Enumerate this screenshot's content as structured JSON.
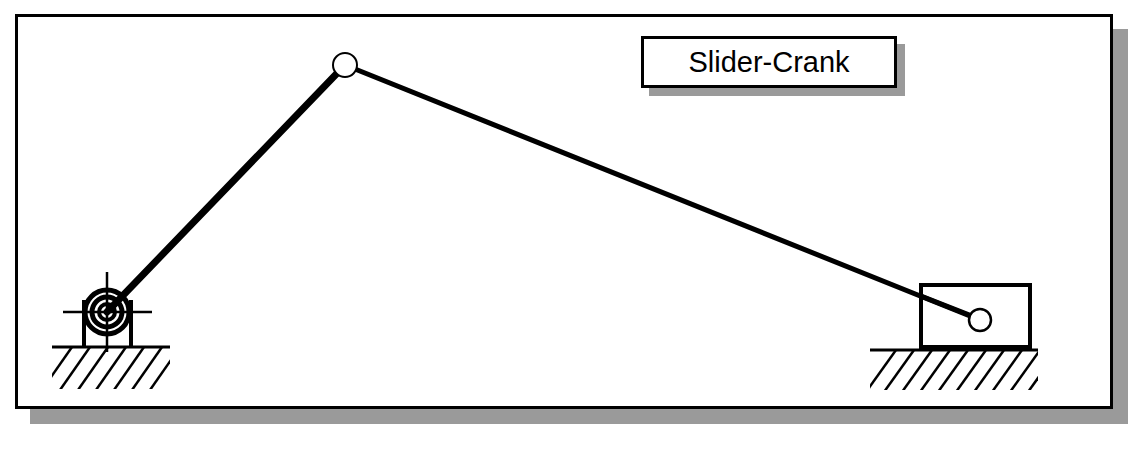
{
  "figure": {
    "title": "Slider-Crank",
    "type": "mechanism-diagram",
    "background_color": "#ffffff",
    "line_color": "#000000",
    "shadow_color": "#9a9a9a"
  },
  "frame": {
    "x": 15,
    "y": 14,
    "width": 1098,
    "height": 395,
    "border_width": 3,
    "shadow_offset": 15
  },
  "title_box": {
    "label": "Slider-Crank",
    "x": 641,
    "y": 36,
    "width": 256,
    "height": 52,
    "border_width": 3,
    "shadow_offset": 8
  },
  "mechanism": {
    "joints": [
      {
        "name": "ground-pivot",
        "type": "revolute-fixed",
        "x": 107,
        "y": 312,
        "bearing_radii": [
          10,
          16,
          22
        ]
      },
      {
        "name": "crank-pin",
        "type": "revolute",
        "x": 345,
        "y": 65,
        "radius": 12
      },
      {
        "name": "slider-pin",
        "type": "revolute",
        "x": 980,
        "y": 320,
        "radius": 11
      }
    ],
    "links": [
      {
        "name": "crank",
        "from": "ground-pivot",
        "to": "crank-pin",
        "x1": 107,
        "y1": 312,
        "x2": 345,
        "y2": 65,
        "stroke_width": 7
      },
      {
        "name": "connecting-rod",
        "from": "crank-pin",
        "to": "slider-pin",
        "x1": 345,
        "y1": 65,
        "x2": 980,
        "y2": 320,
        "stroke_width": 5
      }
    ],
    "slider_block": {
      "name": "slider",
      "x": 921,
      "y": 285,
      "width": 109,
      "height": 62,
      "stroke_width": 4
    },
    "pedestal": {
      "name": "pivot-pedestal",
      "left_wall_x": 84,
      "right_wall_x": 131,
      "top_y": 300,
      "bottom_y": 347,
      "stroke_width": 4
    },
    "centerlines": {
      "horizontal": {
        "x1": 63,
        "x2": 152,
        "y": 312
      },
      "vertical": {
        "x": 107,
        "y1": 272,
        "y2": 352
      },
      "stroke_width": 2
    },
    "grounds": [
      {
        "name": "ground-left",
        "x1": 52,
        "x2": 170,
        "y": 347,
        "hatch_count": 7
      },
      {
        "name": "ground-right",
        "x1": 870,
        "x2": 1038,
        "y": 350,
        "hatch_count": 10
      }
    ]
  }
}
